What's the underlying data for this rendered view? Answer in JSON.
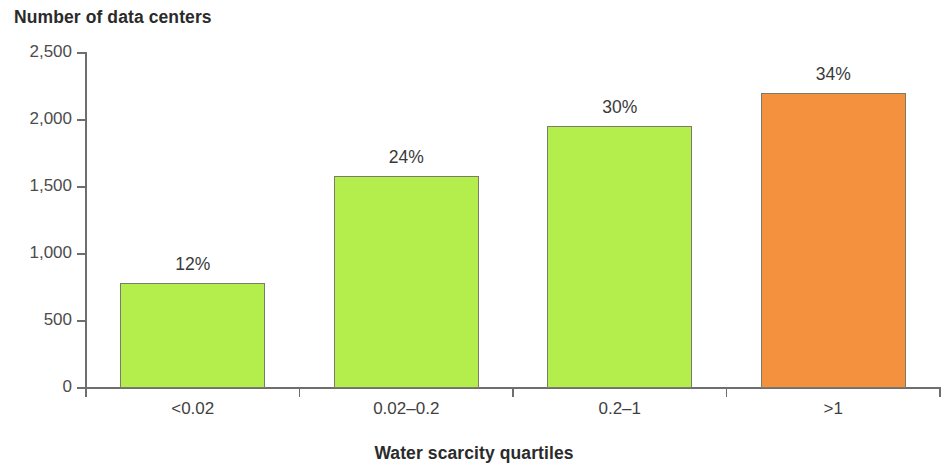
{
  "chart_data": {
    "type": "bar",
    "title": "",
    "xlabel": "Water scarcity quartiles",
    "ylabel": "Number of data centers",
    "categories": [
      "<0.02",
      "0.02–0.2",
      "0.2–1",
      ">1"
    ],
    "values": [
      780,
      1585,
      1955,
      2200
    ],
    "data_labels": [
      "12%",
      "24%",
      "30%",
      "34%"
    ],
    "bar_colors": [
      "#b3ee4c",
      "#b3ee4c",
      "#b3ee4c",
      "#f4913e"
    ],
    "series": [
      {
        "name": "Number of data centers",
        "values": [
          780,
          1585,
          1955,
          2200
        ]
      }
    ],
    "ylim": [
      0,
      2500
    ],
    "yticks": [
      0,
      500,
      1000,
      1500,
      2000,
      2500
    ],
    "ytick_labels": [
      "0",
      "500",
      "1,000",
      "1,500",
      "2,000",
      "2,500"
    ],
    "grid": false,
    "legend": null,
    "legend_position": "none",
    "accent_color_green": "#b3ee4c",
    "accent_color_orange": "#f4913e",
    "axis_color": "#6e6e6e",
    "text_color": "#2b2b2b"
  },
  "axes": {
    "y_title": "Number of data centers",
    "x_title": "Water scarcity quartiles"
  },
  "ticks": {
    "y": [
      {
        "label": "2,500",
        "value": 2500
      },
      {
        "label": "2,000",
        "value": 2000
      },
      {
        "label": "1,500",
        "value": 1500
      },
      {
        "label": "1,000",
        "value": 1000
      },
      {
        "label": "500",
        "value": 500
      },
      {
        "label": "0",
        "value": 0
      }
    ],
    "x": [
      {
        "label": "<0.02"
      },
      {
        "label": "0.02–0.2"
      },
      {
        "label": "0.2–1"
      },
      {
        "label": ">1"
      }
    ]
  },
  "bars": [
    {
      "label": "<0.02",
      "value": 780,
      "data_label": "12%",
      "color": "#b3ee4c"
    },
    {
      "label": "0.02–0.2",
      "value": 1585,
      "data_label": "24%",
      "color": "#b3ee4c"
    },
    {
      "label": "0.2–1",
      "value": 1955,
      "data_label": "30%",
      "color": "#b3ee4c"
    },
    {
      "label": ">1",
      "value": 2200,
      "data_label": "34%",
      "color": "#f4913e"
    }
  ]
}
